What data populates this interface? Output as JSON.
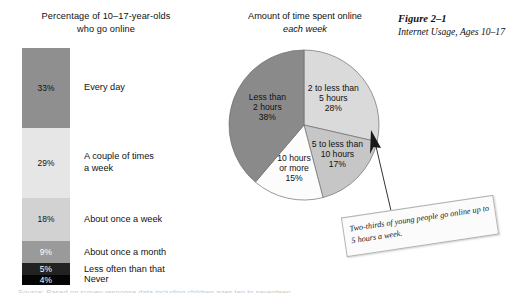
{
  "figure": {
    "number": "Figure 2–1",
    "description": "Internet Usage, Ages 10–17"
  },
  "bar_panel": {
    "title_line1": "Percentage of 10–17-year-olds",
    "title_line2": "who go online"
  },
  "pie_panel": {
    "title_line1": "Amount of time spent online",
    "title_line2": "each week"
  },
  "callout": {
    "text": "Two-thirds of young people go online up to 5 hours a week."
  },
  "source_line": {
    "text": "Source: Based on survey response data including children ages ten to seventeen."
  },
  "chart_data": [
    {
      "type": "bar",
      "orientation": "vertical-stacked",
      "title": "Percentage of 10–17-year-olds who go online",
      "xlabel": "",
      "ylabel": "",
      "categories": [
        "Every day",
        "A couple of times a week",
        "About once a week",
        "About once a month",
        "Less often than that",
        "Never"
      ],
      "values": [
        33,
        29,
        18,
        9,
        5,
        4
      ],
      "value_labels": [
        "33%",
        "29%",
        "18%",
        "9%",
        "5%",
        "4%"
      ],
      "label_lines": [
        "Every day",
        "A couple of times\na week",
        "About once a week",
        "About once a month",
        "Less often than that",
        "Never"
      ],
      "colors": [
        "#8f8f8f",
        "#e6e6e6",
        "#d2d2d2",
        "#9a9a9a",
        "#222222",
        "#050505"
      ],
      "text_colors": [
        "#111111",
        "#111111",
        "#111111",
        "#ffffff",
        "#ffffff",
        "#ffffff"
      ],
      "ylim": [
        0,
        100
      ],
      "grid": false,
      "legend": "none"
    },
    {
      "type": "pie",
      "title": "Amount of time spent online each week",
      "labels": [
        "2 to less than 5 hours",
        "5 to less than 10 hours",
        "10 hours or more",
        "Less than 2 hours"
      ],
      "values": [
        28,
        17,
        15,
        38
      ],
      "value_labels": [
        "28%",
        "17%",
        "15%",
        "38%"
      ],
      "label_lines": [
        [
          "2 to less than",
          "5 hours",
          "28%"
        ],
        [
          "5 to less than",
          "10 hours",
          "17%"
        ],
        [
          "10 hours",
          "or more",
          "15%"
        ],
        [
          "Less than",
          "2 hours",
          "38%"
        ]
      ],
      "colors": [
        "#dadada",
        "#c6c6c6",
        "#fcfcfc",
        "#8a8a8a"
      ],
      "start_angle_deg": 0,
      "direction": "clockwise",
      "legend": "none"
    }
  ]
}
